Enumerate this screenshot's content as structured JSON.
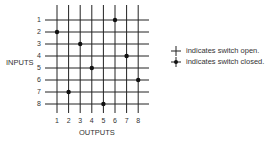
{
  "diagram": {
    "y_axis_label": "INPUTS",
    "x_axis_label": "OUTPUTS",
    "inputs": [
      "1",
      "2",
      "3",
      "4",
      "5",
      "6",
      "7",
      "8"
    ],
    "outputs": [
      "1",
      "2",
      "3",
      "4",
      "5",
      "6",
      "7",
      "8"
    ],
    "closed_switches": [
      {
        "input": 1,
        "output": 6
      },
      {
        "input": 2,
        "output": 1
      },
      {
        "input": 3,
        "output": 3
      },
      {
        "input": 4,
        "output": 7
      },
      {
        "input": 5,
        "output": 4
      },
      {
        "input": 6,
        "output": 8
      },
      {
        "input": 7,
        "output": 2
      },
      {
        "input": 8,
        "output": 5
      }
    ]
  },
  "legend": {
    "open_text": "indicates switch open.",
    "closed_text": "indicates switch closed."
  }
}
